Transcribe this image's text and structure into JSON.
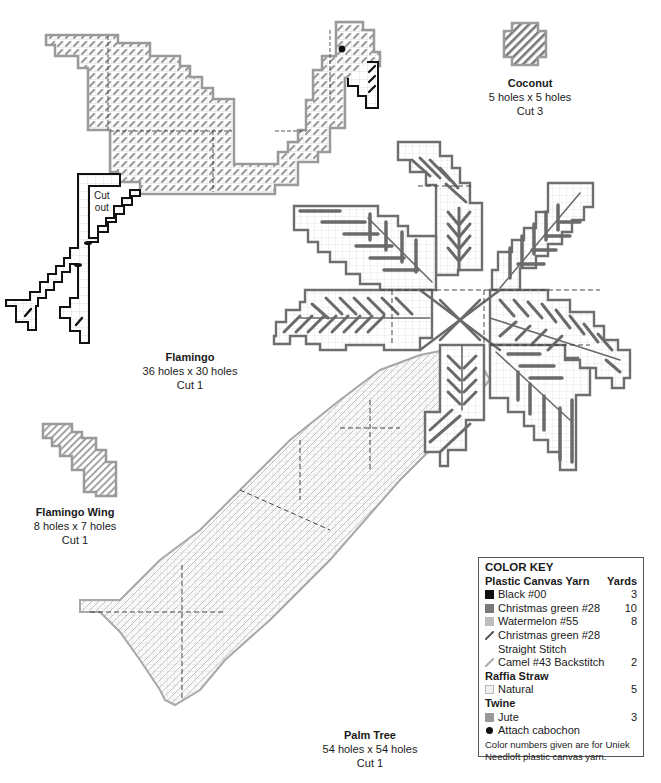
{
  "pieces": {
    "flamingo": {
      "title": "Flamingo",
      "size": "36 holes x 30 holes",
      "cut": "Cut 1",
      "cutout_text": [
        "Cut",
        "out"
      ]
    },
    "coconut": {
      "title": "Coconut",
      "size": "5 holes x 5 holes",
      "cut": "Cut 3"
    },
    "flamingo_wing": {
      "title": "Flamingo Wing",
      "size": "8 holes x 7 holes",
      "cut": "Cut 1"
    },
    "palm_tree": {
      "title": "Palm Tree",
      "size": "54 holes x 54 holes",
      "cut": "Cut 1"
    }
  },
  "color_key": {
    "title": "COLOR KEY",
    "sections": [
      {
        "heading": "Plastic Canvas Yarn",
        "yards_heading": "Yards",
        "items": [
          {
            "label": "Black #00",
            "yards": "3",
            "swatch": "square",
            "color": "#111111"
          },
          {
            "label": "Christmas green #28",
            "yards": "10",
            "swatch": "square",
            "color": "#7a7a7a"
          },
          {
            "label": "Watermelon #55",
            "yards": "8",
            "swatch": "square",
            "color": "#bdbdbd"
          },
          {
            "label": "Christmas green #28",
            "label2": "Straight Stitch",
            "yards": "",
            "swatch": "slash",
            "color": "#666666"
          },
          {
            "label": "Camel #43 Backstitch",
            "yards": "2",
            "swatch": "slash",
            "color": "#aaaaaa"
          }
        ]
      },
      {
        "heading": "Raffia Straw",
        "items": [
          {
            "label": "Natural",
            "yards": "5",
            "swatch": "square",
            "color": "#eeeeee"
          }
        ]
      },
      {
        "heading": "Twine",
        "items": [
          {
            "label": "Jute",
            "yards": "3",
            "swatch": "square",
            "color": "#999999"
          }
        ]
      }
    ],
    "bullet_item": "Attach cabochon",
    "note": "Color numbers given are for Uniek Needloft plastic canvas yarn."
  },
  "colors": {
    "black": "#111111",
    "christmas_green": "#7a7a7a",
    "watermelon": "#b5b5b5",
    "natural": "#e8e8e8",
    "outline_gray": "#9a9a9a",
    "frond_outline": "#6e6e6e"
  }
}
